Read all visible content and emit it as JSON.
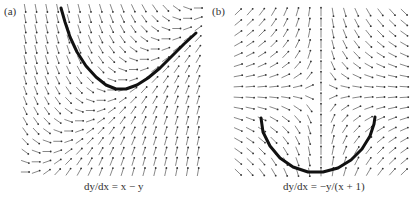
{
  "figure": {
    "panels": [
      {
        "label": "(a)",
        "caption": "dy/dx = x − y",
        "equation": "x - y",
        "field": {
          "px_left": 25,
          "px_right": 198,
          "px_top": 8,
          "px_bottom": 172,
          "xmin": -3,
          "xmax": 3,
          "ymin": -3,
          "ymax": 3,
          "cols": 17,
          "rows": 17
        },
        "solution_curve": [
          [
            61,
            8
          ],
          [
            65,
            22
          ],
          [
            70,
            37
          ],
          [
            77,
            52
          ],
          [
            86,
            66
          ],
          [
            96,
            77
          ],
          [
            106,
            85
          ],
          [
            116,
            89
          ],
          [
            126,
            89
          ],
          [
            137,
            85
          ],
          [
            148,
            78
          ],
          [
            160,
            68
          ],
          [
            172,
            56
          ],
          [
            184,
            44
          ],
          [
            196,
            33
          ]
        ]
      },
      {
        "label": "(b)",
        "caption": "dy/dx = −y/(x + 1)",
        "equation": "-y/(x+1)",
        "field": {
          "px_left": 238,
          "px_right": 404,
          "px_top": 12,
          "px_bottom": 172,
          "xmin": -4,
          "xmax": 2,
          "ymin": -3,
          "ymax": 3,
          "cols": 15,
          "rows": 16
        },
        "solution_curve": [
          [
            261,
            118
          ],
          [
            263,
            132
          ],
          [
            270,
            146
          ],
          [
            280,
            158
          ],
          [
            293,
            167
          ],
          [
            308,
            172
          ],
          [
            323,
            172
          ],
          [
            338,
            168
          ],
          [
            351,
            160
          ],
          [
            362,
            149
          ],
          [
            370,
            136
          ],
          [
            374,
            124
          ],
          [
            375,
            117
          ]
        ]
      }
    ]
  },
  "chart_data": [
    {
      "type": "slope_field",
      "title": "(a)",
      "xlabel": "dy/dx = x − y",
      "equation": "dy/dx = x - y",
      "grid": false,
      "solution_curve_shape": "U-shaped curve: steep descent from top-left, minimum near center, rising toward right edge"
    },
    {
      "type": "slope_field",
      "title": "(b)",
      "xlabel": "dy/dx = −y/(x + 1)",
      "equation": "dy/dx = -y/(x+1)",
      "grid": false,
      "solution_curve_shape": "semicircular arc below the singular point x = -1"
    }
  ]
}
